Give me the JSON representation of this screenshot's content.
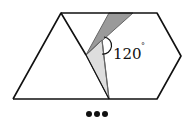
{
  "figure": {
    "angle_label": "120",
    "degree_symbol": "°",
    "continuation": "•••",
    "colors": {
      "stroke": "#111111",
      "dark_fill": "#9a9a9a",
      "light_fill": "#dedede",
      "gray_edge": "#666666",
      "background": "#ffffff"
    }
  }
}
